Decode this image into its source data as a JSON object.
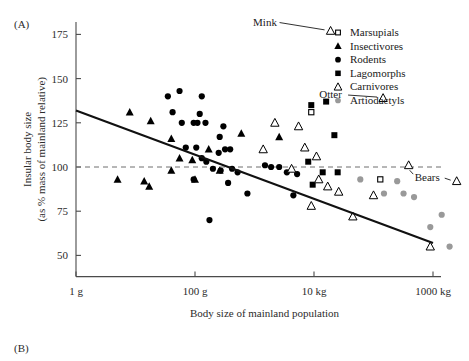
{
  "figure": {
    "panel_a_label": "(A)",
    "panel_b_label": "(B)"
  },
  "chart_data": {
    "type": "scatter",
    "title": "",
    "xlabel": "Body size of mainland population",
    "ylabel": "Insular body size\n(as % mass of mainland relative)",
    "ylabel_line1": "Insular body size",
    "ylabel_line2": "(as % mass of mainland relative)",
    "x_scale": "log",
    "x_tick_labels": [
      "1 g",
      "100 g",
      "10 kg",
      "1000 kg"
    ],
    "x_tick_values": [
      1,
      100,
      10000,
      1000000
    ],
    "xlim": [
      1,
      1000000
    ],
    "y_tick_labels": [
      "50",
      "75",
      "100",
      "125",
      "150",
      "175"
    ],
    "y_tick_values": [
      50,
      75,
      100,
      125,
      150,
      175
    ],
    "ylim": [
      38,
      182
    ],
    "grid": false,
    "reference_line": {
      "y": 100,
      "style": "dashed",
      "label": ""
    },
    "trend_line": {
      "x_start": 1,
      "y_start": 132,
      "x_end": 1000000,
      "y_end": 57,
      "style": "solid"
    },
    "legend": {
      "position": "top-right",
      "entries": [
        {
          "label": "Marsupials",
          "marker": "open-square",
          "color": "#000000"
        },
        {
          "label": "Insectivores",
          "marker": "filled-triangle",
          "color": "#000000"
        },
        {
          "label": "Rodents",
          "marker": "filled-circle",
          "color": "#000000"
        },
        {
          "label": "Lagomorphs",
          "marker": "filled-square",
          "color": "#000000"
        },
        {
          "label": "Carnivores",
          "marker": "open-triangle",
          "color": "#000000"
        },
        {
          "label": "Artiodactyls",
          "marker": "filled-circle",
          "color": "#999999"
        }
      ]
    },
    "annotations": [
      {
        "text": "Mink",
        "text_x": 1500,
        "text_y": 180,
        "point_x": 19000,
        "point_y": 177
      },
      {
        "text": "Otter",
        "text_x": 19000,
        "text_y": 139,
        "point_x": 145000,
        "point_y": 139
      },
      {
        "text": "Bears",
        "text_x": 800000,
        "text_y": 92,
        "point_x": 2500000,
        "point_y": 92
      }
    ],
    "series": [
      {
        "name": "Marsupials",
        "marker": "open-square",
        "color": "#000000",
        "points": [
          [
            9000,
            131
          ],
          [
            130000,
            93
          ]
        ]
      },
      {
        "name": "Insectivores",
        "marker": "filled-triangle",
        "color": "#000000",
        "points": [
          [
            8,
            131
          ],
          [
            18,
            126
          ],
          [
            5,
            93
          ],
          [
            14,
            92
          ],
          [
            17,
            89
          ],
          [
            40,
            116
          ],
          [
            55,
            105
          ],
          [
            40,
            98
          ],
          [
            90,
            104
          ],
          [
            100,
            93
          ],
          [
            170,
            110
          ],
          [
            260,
            98
          ],
          [
            600,
            119
          ],
          [
            2600,
            117
          ]
        ]
      },
      {
        "name": "Rodents",
        "marker": "filled-circle",
        "color": "#000000",
        "points": [
          [
            55,
            143
          ],
          [
            35,
            140
          ],
          [
            130,
            140
          ],
          [
            42,
            131
          ],
          [
            120,
            130
          ],
          [
            60,
            125
          ],
          [
            95,
            125
          ],
          [
            110,
            125
          ],
          [
            150,
            125
          ],
          [
            300,
            123
          ],
          [
            260,
            117
          ],
          [
            105,
            111
          ],
          [
            320,
            110
          ],
          [
            390,
            110
          ],
          [
            70,
            111
          ],
          [
            130,
            105
          ],
          [
            155,
            103
          ],
          [
            250,
            108
          ],
          [
            200,
            99
          ],
          [
            270,
            98
          ],
          [
            420,
            99
          ],
          [
            520,
            97
          ],
          [
            95,
            93
          ],
          [
            360,
            91
          ],
          [
            760,
            85
          ],
          [
            175,
            70
          ],
          [
            2600,
            100
          ],
          [
            3500,
            97
          ],
          [
            5200,
            96
          ],
          [
            1500,
            101
          ],
          [
            1900,
            100
          ],
          [
            4500,
            84
          ]
        ]
      },
      {
        "name": "Lagomorphs",
        "marker": "filled-square",
        "color": "#000000",
        "points": [
          [
            9000,
            135
          ],
          [
            16000,
            137
          ],
          [
            22000,
            118
          ],
          [
            8000,
            103
          ],
          [
            14000,
            97
          ],
          [
            25000,
            97
          ],
          [
            9500,
            90
          ]
        ]
      },
      {
        "name": "Carnivores",
        "marker": "open-triangle",
        "color": "#000000",
        "points": [
          [
            19000,
            177
          ],
          [
            145000,
            139
          ],
          [
            2200,
            125
          ],
          [
            1400,
            110
          ],
          [
            5500,
            123
          ],
          [
            7000,
            111
          ],
          [
            11000,
            106
          ],
          [
            4200,
            99
          ],
          [
            12000,
            93
          ],
          [
            17000,
            89
          ],
          [
            26000,
            86
          ],
          [
            9000,
            78
          ],
          [
            100000,
            84
          ],
          [
            45000,
            72
          ],
          [
            390000,
            101
          ],
          [
            2500000,
            92
          ],
          [
            900000,
            55
          ]
        ]
      },
      {
        "name": "Artiodactyls",
        "marker": "filled-circle",
        "color": "#999999",
        "points": [
          [
            60000,
            93
          ],
          [
            250000,
            92
          ],
          [
            150000,
            85
          ],
          [
            320000,
            85
          ],
          [
            480000,
            83
          ],
          [
            1400000,
            73
          ],
          [
            900000,
            66
          ],
          [
            1900000,
            55
          ]
        ]
      }
    ]
  }
}
